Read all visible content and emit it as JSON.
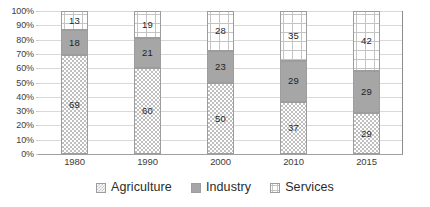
{
  "chart_data": {
    "type": "bar",
    "subtype": "100% stacked column",
    "title": "",
    "xlabel": "",
    "ylabel": "",
    "ylim": [
      0,
      100
    ],
    "ytick_labels": [
      "0%",
      "10%",
      "20%",
      "30%",
      "40%",
      "50%",
      "60%",
      "70%",
      "80%",
      "90%",
      "100%"
    ],
    "ytick_values": [
      0,
      10,
      20,
      30,
      40,
      50,
      60,
      70,
      80,
      90,
      100
    ],
    "grid": true,
    "legend_position": "bottom",
    "categories": [
      "1980",
      "1990",
      "2000",
      "2010",
      "2015"
    ],
    "series": [
      {
        "name": "Agriculture",
        "values": [
          69,
          60,
          50,
          37,
          29
        ],
        "pattern": "checkerboard",
        "color": "#bfbfbf"
      },
      {
        "name": "Industry",
        "values": [
          18,
          21,
          23,
          29,
          29
        ],
        "pattern": "solid",
        "color": "#a6a6a6"
      },
      {
        "name": "Services",
        "values": [
          13,
          19,
          28,
          35,
          42
        ],
        "pattern": "grid",
        "color": "#ffffff"
      }
    ]
  },
  "axis": {
    "y_ticks": [
      {
        "label": "100%",
        "value": 100
      },
      {
        "label": "90%",
        "value": 90
      },
      {
        "label": "80%",
        "value": 80
      },
      {
        "label": "70%",
        "value": 70
      },
      {
        "label": "60%",
        "value": 60
      },
      {
        "label": "50%",
        "value": 50
      },
      {
        "label": "40%",
        "value": 40
      },
      {
        "label": "30%",
        "value": 30
      },
      {
        "label": "20%",
        "value": 20
      },
      {
        "label": "10%",
        "value": 10
      },
      {
        "label": "0%",
        "value": 0
      }
    ],
    "x_ticks": [
      "1980",
      "1990",
      "2000",
      "2010",
      "2015"
    ]
  },
  "legend": {
    "items": [
      {
        "label": "Agriculture",
        "swatch": "checkerboard-swatch"
      },
      {
        "label": "Industry",
        "swatch": "solid-grey-swatch"
      },
      {
        "label": "Services",
        "swatch": "grid-swatch"
      }
    ]
  },
  "colors": {
    "agriculture": "#bfbfbf",
    "industry": "#a6a6a6",
    "services": "#ffffff",
    "gridline": "#d9d9d9",
    "axis": "#8c8c8c",
    "text": "#2b2b2b"
  }
}
